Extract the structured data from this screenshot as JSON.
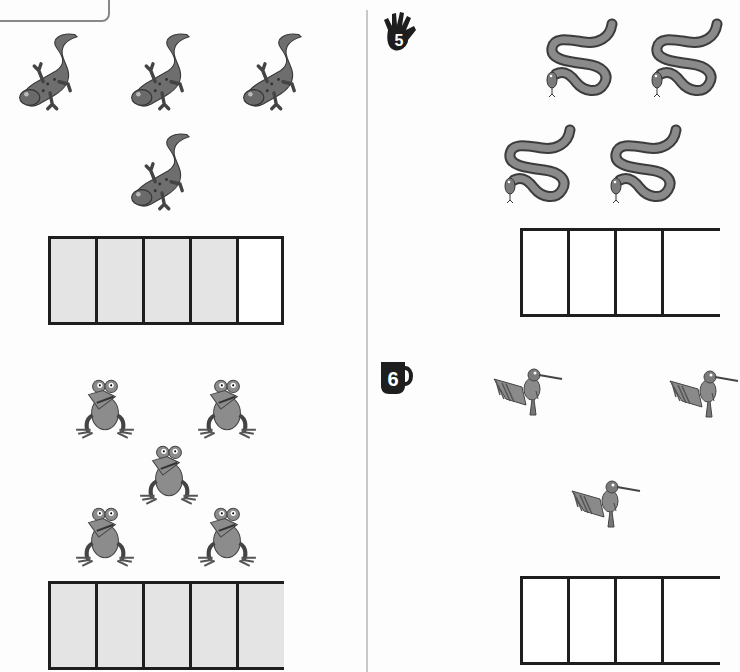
{
  "worksheet": {
    "left_column": {
      "lizards": {
        "count": 4,
        "icon": "lizard-icon",
        "ten_frame": {
          "cells": 5,
          "filled": 4
        }
      },
      "frogs": {
        "count": 5,
        "icon": "frog-icon",
        "ten_frame": {
          "cells": 5,
          "filled": 5
        }
      }
    },
    "right_column": {
      "exercise_5": {
        "number": "5",
        "badge_icon": "hand-icon",
        "picture_icon": "snake-icon",
        "visible_count": 4,
        "ten_frame": {
          "cells_visible": 4,
          "filled": 0
        }
      },
      "exercise_6": {
        "number": "6",
        "badge_icon": "mug-icon",
        "picture_icon": "hummingbird-icon",
        "visible_count": 3,
        "ten_frame": {
          "cells_visible": 4,
          "filled": 0
        }
      }
    },
    "colors": {
      "frame_border": "#1e1e1e",
      "filled_cell": "#e4e4e4",
      "divider": "#c8c8c8",
      "picture_fill": "#6e6e6e"
    }
  }
}
